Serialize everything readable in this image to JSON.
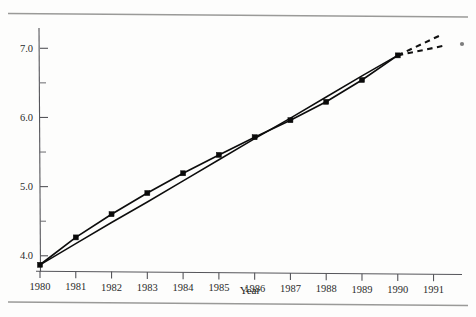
{
  "figure": {
    "name": "line-chart-scan",
    "axis_title_x": "Year",
    "axis_title_y": "",
    "title": ""
  },
  "chart_data": {
    "type": "line",
    "title": "",
    "xlabel": "Year",
    "ylabel": "",
    "xlim": [
      1980,
      1991.6
    ],
    "ylim": [
      3.78,
      7.25
    ],
    "grid": false,
    "legend": "none",
    "x_ticks": [
      1980,
      1981,
      1982,
      1983,
      1984,
      1985,
      1986,
      1987,
      1988,
      1989,
      1990,
      1991
    ],
    "x_tick_labels": [
      "1980",
      "1981",
      "1982",
      "1983",
      "1984",
      "1985",
      "1986",
      "1987",
      "1988",
      "1989",
      "1990",
      "1991"
    ],
    "y_ticks": [
      4.0,
      4.5,
      5.0,
      5.5,
      6.0,
      6.5,
      7.0
    ],
    "y_tick_labels": [
      "4.0",
      "",
      "5.0",
      "",
      "6.0",
      "",
      "7.0"
    ],
    "y_major_ticks": [
      4.0,
      5.0,
      6.0,
      7.0
    ],
    "y_minor_ticks": [
      4.5,
      5.5,
      6.5
    ],
    "x": [
      1980,
      1981,
      1982,
      1983,
      1984,
      1985,
      1986,
      1987,
      1988,
      1989,
      1990
    ],
    "series": [
      {
        "name": "observed",
        "style": "solid-with-markers",
        "marker": "filled-square",
        "values": [
          3.87,
          4.27,
          4.61,
          4.92,
          5.21,
          5.48,
          5.74,
          5.99,
          6.26,
          6.58,
          6.94
        ]
      },
      {
        "name": "trend",
        "style": "solid-straight",
        "marker": "none",
        "values": [
          3.87,
          4.18,
          4.49,
          4.79,
          5.1,
          5.41,
          5.72,
          6.02,
          6.33,
          6.64,
          6.94
        ]
      }
    ],
    "projections": [
      {
        "name": "upper-projection",
        "style": "dashed",
        "x": [
          1990,
          1991.25
        ],
        "values": [
          6.94,
          7.25
        ]
      },
      {
        "name": "lower-projection",
        "style": "dashed",
        "x": [
          1990,
          1991.25
        ],
        "values": [
          6.94,
          7.08
        ]
      }
    ],
    "annotations": []
  }
}
